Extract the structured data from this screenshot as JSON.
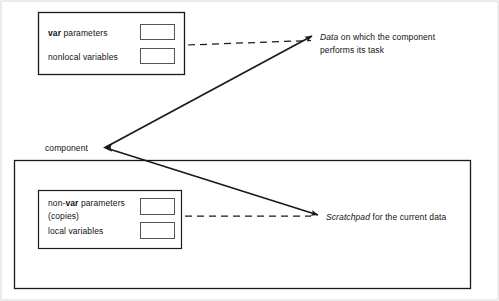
{
  "diagram": {
    "title_alt": "component data and scratchpad diagram",
    "stroke_color": "#1a1a1a",
    "fill_color": "#ffffff"
  },
  "top_box": {
    "row1_prefix": "var",
    "row1_text": " parameters",
    "row2_text": "nonlocal variables",
    "slot1_label": "",
    "slot2_label": ""
  },
  "bottom_box": {
    "row1_prefix_a": "non-",
    "row1_prefix_b": "var",
    "row1_text": " parameters",
    "row1_second_line": "(copies)",
    "row2_text": "local variables",
    "slot1_label": "",
    "slot2_label": ""
  },
  "labels": {
    "component": "component",
    "data_italic": "Data",
    "data_rest": " on which the component",
    "data_line2": "performs its task",
    "scratchpad_italic": "Scratchpad",
    "scratchpad_rest": " for the current data"
  }
}
